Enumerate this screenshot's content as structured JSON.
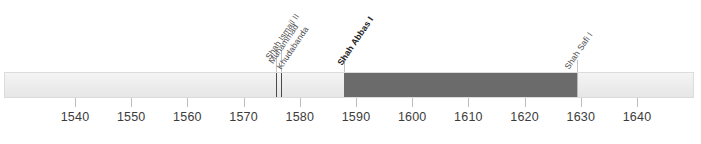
{
  "chart_data": {
    "type": "bar",
    "title": "",
    "subtitle": "",
    "xlabel": "",
    "ylabel": "",
    "orientation": "horizontal",
    "axis": {
      "xlim": [
        1533,
        1656
      ],
      "tick_labels": [
        "1540",
        "1550",
        "1560",
        "1570",
        "1580",
        "1590",
        "1600",
        "1610",
        "1620",
        "1630",
        "1640"
      ],
      "tick_values": [
        1540,
        1550,
        1560,
        1570,
        1580,
        1590,
        1600,
        1610,
        1620,
        1630,
        1640
      ],
      "grid": false,
      "legend": "none"
    },
    "categories": [
      "Shah Ismail II",
      "Muhammad Khudabanda",
      "Shah Abbas I",
      "Shah Safi I"
    ],
    "series": [
      {
        "name": "Reign spans",
        "values": [
          2,
          10,
          41,
          13
        ]
      }
    ],
    "annotations": [
      {
        "label": "Shah Ismail II",
        "label_lines": [
          "Shah Ismail II"
        ],
        "start": 1576,
        "end": 1578,
        "style": "divider",
        "emphasis": "normal",
        "color": "#4a4a4a"
      },
      {
        "label": "Muhammad Khudabanda",
        "label_lines": [
          "Muhammad",
          "Khudabanda"
        ],
        "start": 1578,
        "end": 1588,
        "style": "light",
        "emphasis": "normal",
        "color": "#efefef"
      },
      {
        "label": "Shah Abbas I",
        "label_lines": [
          "Shah Abbas I"
        ],
        "start": 1588,
        "end": 1629,
        "style": "dark",
        "emphasis": "bold",
        "color": "#6b6b6b"
      },
      {
        "label": "Shah Safi I",
        "label_lines": [
          "Shah Safi I"
        ],
        "start": 1629,
        "end": 1642,
        "style": "faint-divider",
        "emphasis": "normal",
        "color": "#b9b9b9"
      }
    ]
  },
  "colors": {
    "track_fill": "#efefef",
    "track_border": "#dcdcdc",
    "highlight": "#6b6b6b",
    "divider": "#4a4a4a",
    "faint_divider": "#b9b9b9",
    "tick": "#bdbdbd",
    "tick_text": "#3c3c3c",
    "label_text": "#4d4d4d",
    "label_text_bold": "#1c1c1c",
    "background": "#ffffff"
  }
}
